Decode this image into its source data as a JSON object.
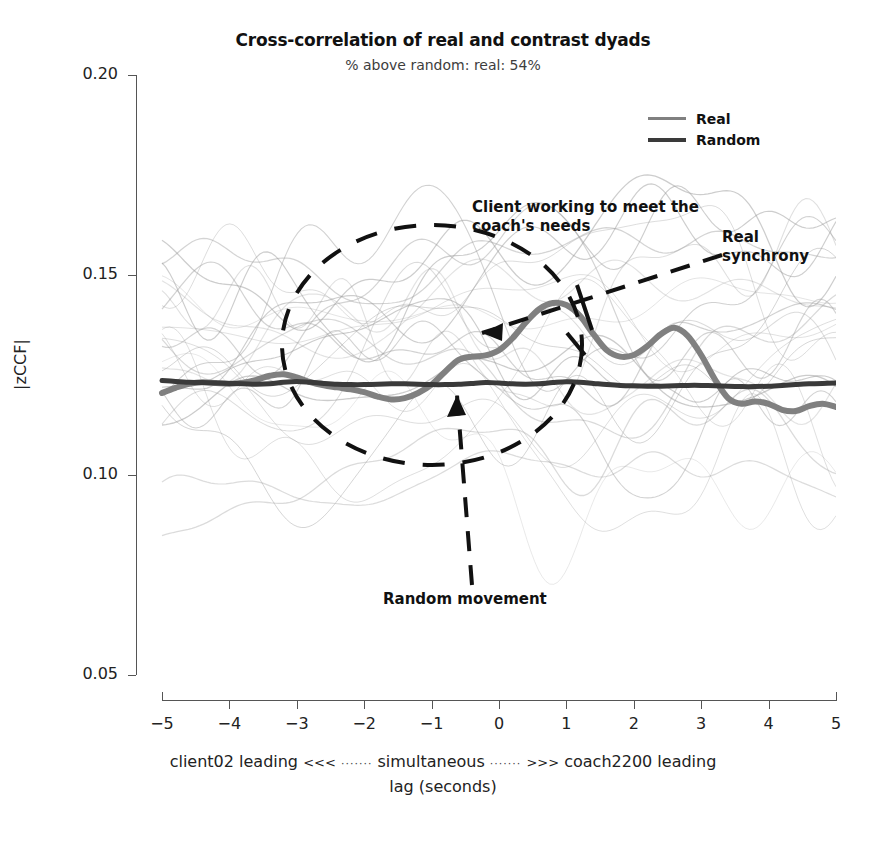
{
  "chart_data": {
    "type": "line",
    "title": "Cross-correlation of real and contrast dyads",
    "subtitle": "% above random: real: 54%",
    "xlabel": "lag (seconds)",
    "xlabel_left": "client02 leading",
    "xlabel_arrow_left": "<<<",
    "xlabel_center": "simultaneous",
    "xlabel_arrow_right": ">>>",
    "xlabel_right": "coach2200 leading",
    "ylabel": "|zCCF|",
    "xlim": [
      -5,
      5
    ],
    "ylim": [
      0.05,
      0.2
    ],
    "xticks": [
      "-5",
      "-4",
      "-3",
      "-2",
      "-1",
      "0",
      "1",
      "2",
      "3",
      "4",
      "5"
    ],
    "xtick_values": [
      -5,
      -4,
      -3,
      -2,
      -1,
      0,
      1,
      2,
      3,
      4,
      5
    ],
    "yticks": [
      "0.20",
      "0.15",
      "0.10",
      "0.05"
    ],
    "ytick_values": [
      0.2,
      0.15,
      0.1,
      0.05
    ],
    "grid": false,
    "legend_position": "top-right",
    "x": [
      -5.0,
      -4.8,
      -4.6,
      -4.4,
      -4.2,
      -4.0,
      -3.8,
      -3.6,
      -3.4,
      -3.2,
      -3.0,
      -2.8,
      -2.6,
      -2.4,
      -2.2,
      -2.0,
      -1.8,
      -1.6,
      -1.4,
      -1.2,
      -1.0,
      -0.8,
      -0.6,
      -0.4,
      -0.2,
      0.0,
      0.2,
      0.4,
      0.6,
      0.8,
      1.0,
      1.2,
      1.4,
      1.6,
      1.8,
      2.0,
      2.2,
      2.4,
      2.6,
      2.8,
      3.0,
      3.2,
      3.4,
      3.6,
      3.8,
      4.0,
      4.2,
      4.4,
      4.6,
      4.8,
      5.0
    ],
    "series": [
      {
        "name": "Real",
        "color": "#808080",
        "linewidth": 6,
        "values": [
          0.1205,
          0.1218,
          0.1228,
          0.1232,
          0.123,
          0.1228,
          0.1231,
          0.1238,
          0.1248,
          0.1252,
          0.1244,
          0.1232,
          0.1224,
          0.1219,
          0.1214,
          0.1207,
          0.1196,
          0.1189,
          0.1192,
          0.1205,
          0.1226,
          0.1258,
          0.1288,
          0.1296,
          0.1299,
          0.1312,
          0.1342,
          0.1382,
          0.1415,
          0.143,
          0.1425,
          0.1398,
          0.1352,
          0.1312,
          0.1296,
          0.13,
          0.1322,
          0.1352,
          0.1368,
          0.1348,
          0.13,
          0.124,
          0.1192,
          0.1178,
          0.1184,
          0.1178,
          0.1163,
          0.116,
          0.1172,
          0.1178,
          0.117
        ]
      },
      {
        "name": "Random",
        "color": "#3a3a3a",
        "linewidth": 5,
        "values": [
          0.1236,
          0.1234,
          0.1232,
          0.1231,
          0.123,
          0.1229,
          0.1228,
          0.1227,
          0.1228,
          0.1232,
          0.1234,
          0.1232,
          0.1229,
          0.1227,
          0.1226,
          0.1226,
          0.1227,
          0.1228,
          0.1228,
          0.1227,
          0.1226,
          0.1226,
          0.1227,
          0.1229,
          0.1231,
          0.123,
          0.1228,
          0.1227,
          0.1228,
          0.1231,
          0.1233,
          0.1232,
          0.1229,
          0.1226,
          0.1224,
          0.1223,
          0.1222,
          0.1222,
          0.1223,
          0.1224,
          0.1224,
          0.1223,
          0.1222,
          0.1221,
          0.1221,
          0.1222,
          0.1224,
          0.1226,
          0.1228,
          0.1229,
          0.123
        ]
      }
    ],
    "background_traces_note": "faint light-grey individual contrast dyad cross-correlation curves"
  },
  "legend": {
    "items": [
      {
        "label": "Real",
        "color": "#808080"
      },
      {
        "label": "Random",
        "color": "#3a3a3a"
      }
    ]
  },
  "annotations": {
    "client": "Client working to meet the\ncoach's needs",
    "real_synchrony": "Real\nsynchrony",
    "random_movement": "Random movement"
  }
}
